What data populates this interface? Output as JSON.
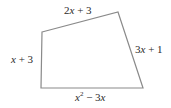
{
  "figure": {
    "type": "quadrilateral",
    "stroke_color": "#8a8a8a",
    "vertices": [
      {
        "name": "top-left",
        "x": 42,
        "y": 32
      },
      {
        "name": "top-right",
        "x": 118,
        "y": 12
      },
      {
        "name": "bottom-right",
        "x": 143,
        "y": 88
      },
      {
        "name": "bottom-left",
        "x": 41,
        "y": 88
      }
    ],
    "sides": {
      "top": {
        "coef": "2",
        "var": "x",
        "rest": " + 3"
      },
      "left": {
        "coef": "",
        "var": "x",
        "rest": " + 3"
      },
      "right": {
        "coef": "3",
        "var": "x",
        "rest": " + 1"
      },
      "bottom": {
        "var": "x",
        "exp": "2",
        "rest": " − 3",
        "var2": "x"
      }
    }
  }
}
